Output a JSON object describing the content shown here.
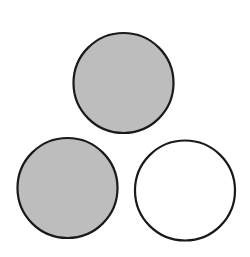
{
  "diagram": {
    "background": "#ffffff",
    "stroke_color": "#1a1a1a",
    "stroke_width": 2.2,
    "circles": [
      {
        "id": "top",
        "cx": 123.5,
        "cy": 83,
        "r": 50,
        "fill": "#bdbdbd",
        "shaded": true
      },
      {
        "id": "bottom-left",
        "cx": 67.5,
        "cy": 188,
        "r": 50,
        "fill": "#bdbdbd",
        "shaded": true
      },
      {
        "id": "bottom-right",
        "cx": 185,
        "cy": 190.5,
        "r": 50,
        "fill": "#ffffff",
        "shaded": false
      }
    ]
  }
}
